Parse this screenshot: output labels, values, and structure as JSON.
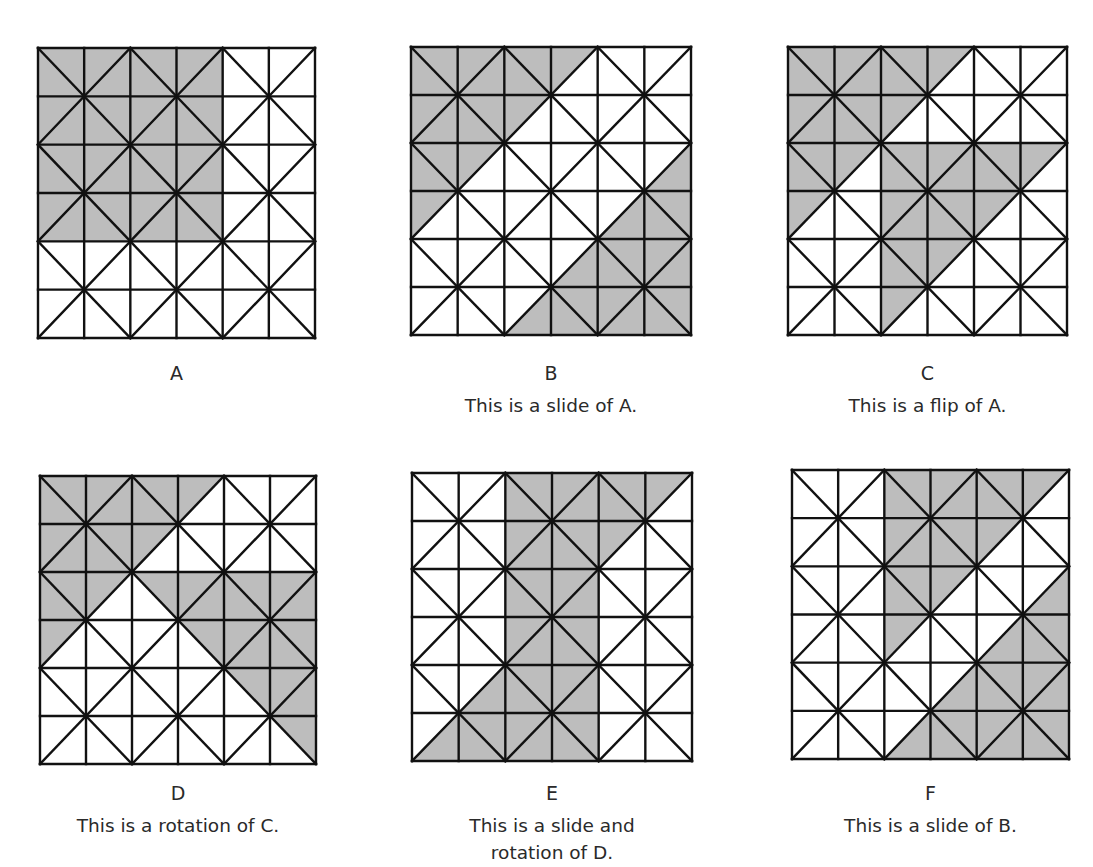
{
  "style": {
    "shade_color": "#bdbdbd",
    "line_color": "#111111",
    "background": "#ffffff"
  },
  "grid_size": 6,
  "panels": [
    {
      "id": "A",
      "label": "A",
      "caption": [],
      "box": {
        "x": 38,
        "y": 48,
        "w": 277,
        "h": 290
      },
      "shaded_polygons": [
        [
          [
            0,
            0
          ],
          [
            4,
            0
          ],
          [
            4,
            4
          ],
          [
            0,
            4
          ]
        ]
      ]
    },
    {
      "id": "B",
      "label": "B",
      "caption": [
        "This is a slide of A."
      ],
      "box": {
        "x": 411,
        "y": 47,
        "w": 280,
        "h": 288
      },
      "shaded_polygons": [
        [
          [
            0,
            0
          ],
          [
            4,
            0
          ],
          [
            0,
            4
          ]
        ],
        [
          [
            6,
            2
          ],
          [
            6,
            6
          ],
          [
            2,
            6
          ]
        ]
      ]
    },
    {
      "id": "C",
      "label": "C",
      "caption": [
        "This is a flip of A."
      ],
      "box": {
        "x": 788,
        "y": 47,
        "w": 279,
        "h": 288
      },
      "shaded_polygons": [
        [
          [
            0,
            0
          ],
          [
            4,
            0
          ],
          [
            0,
            4
          ]
        ],
        [
          [
            2,
            2
          ],
          [
            6,
            2
          ],
          [
            2,
            6
          ]
        ]
      ]
    },
    {
      "id": "D",
      "label": "D",
      "caption": [
        "This is a rotation of C."
      ],
      "box": {
        "x": 40,
        "y": 476,
        "w": 276,
        "h": 288
      },
      "shaded_polygons": [
        [
          [
            0,
            0
          ],
          [
            4,
            0
          ],
          [
            0,
            4
          ]
        ],
        [
          [
            2,
            2
          ],
          [
            6,
            2
          ],
          [
            6,
            6
          ]
        ]
      ]
    },
    {
      "id": "E",
      "label": "E",
      "caption": [
        "This is a slide and",
        "rotation of D."
      ],
      "box": {
        "x": 412,
        "y": 473,
        "w": 280,
        "h": 288
      },
      "shaded_polygons": [
        [
          [
            2,
            0
          ],
          [
            6,
            0
          ],
          [
            4,
            2
          ],
          [
            4,
            6
          ],
          [
            0,
            6
          ],
          [
            2,
            4
          ]
        ]
      ]
    },
    {
      "id": "F",
      "label": "F",
      "caption": [
        "This is a slide of B."
      ],
      "box": {
        "x": 792,
        "y": 470,
        "w": 277,
        "h": 289
      },
      "shaded_polygons": [
        [
          [
            2,
            0
          ],
          [
            6,
            0
          ],
          [
            2,
            4
          ]
        ],
        [
          [
            6,
            2
          ],
          [
            6,
            6
          ],
          [
            2,
            6
          ]
        ]
      ]
    }
  ],
  "label_layout": {
    "top_row": {
      "letter_y": 362,
      "caption_y": 392
    },
    "bottom_row": {
      "letter_y": 782,
      "caption_y": 812
    }
  }
}
